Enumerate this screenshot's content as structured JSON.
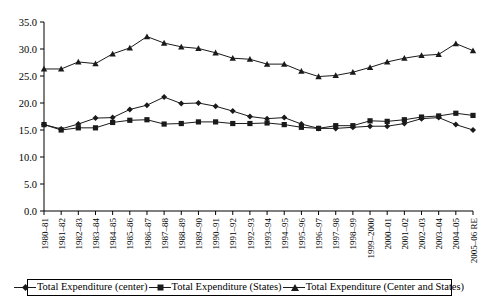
{
  "chart_data": {
    "type": "line",
    "title": "",
    "xlabel": "",
    "ylabel": "",
    "ylim": [
      0.0,
      35.0
    ],
    "yticks": [
      "0.0",
      "5.0",
      "10.0",
      "15.0",
      "20.0",
      "25.0",
      "30.0",
      "35.0"
    ],
    "ytick_values": [
      0.0,
      5.0,
      10.0,
      15.0,
      20.0,
      25.0,
      30.0,
      35.0
    ],
    "grid": false,
    "legend_position": "bottom",
    "categories": [
      "1980–81",
      "1981–82",
      "1982–83",
      "1983–84",
      "1984–85",
      "1985–86",
      "1986–87",
      "1987–88",
      "1988–89",
      "1989–90",
      "1990–91",
      "1991–92",
      "1992–93",
      "1993–94",
      "1994–95",
      "1995–96",
      "1996–97",
      "1997–98",
      "1998–99",
      "1999–2000",
      "2000–01",
      "2001–02",
      "2002–03",
      "2003–04",
      "2004–05",
      "2005–06 RE"
    ],
    "series": [
      {
        "name": "Total Expenditure (center)",
        "marker": "diamond",
        "values": [
          16.0,
          15.2,
          16.1,
          17.2,
          17.3,
          18.8,
          19.6,
          21.1,
          19.9,
          20.0,
          19.4,
          18.5,
          17.5,
          17.1,
          17.3,
          16.1,
          15.3,
          15.3,
          15.5,
          15.7,
          15.7,
          16.2,
          17.1,
          17.3,
          16.0,
          15.0
        ]
      },
      {
        "name": "Total Expenditure (States)",
        "marker": "square",
        "values": [
          16.0,
          15.0,
          15.4,
          15.4,
          16.4,
          16.8,
          16.9,
          16.1,
          16.2,
          16.5,
          16.5,
          16.2,
          16.2,
          16.3,
          16.0,
          15.5,
          15.3,
          15.8,
          15.8,
          16.7,
          16.6,
          16.9,
          17.4,
          17.6,
          18.1,
          17.7
        ]
      },
      {
        "name": "Total Expenditure (Center and States)",
        "marker": "triangle",
        "values": [
          26.3,
          26.3,
          27.6,
          27.3,
          29.1,
          30.2,
          32.3,
          31.1,
          30.4,
          30.1,
          29.3,
          28.3,
          28.1,
          27.2,
          27.2,
          25.9,
          24.9,
          25.1,
          25.7,
          26.6,
          27.6,
          28.3,
          28.8,
          29.0,
          31.0,
          29.7
        ]
      }
    ]
  },
  "legend": {
    "items": [
      {
        "label": "Total Expenditure (center)",
        "marker": "diamond-marker-icon"
      },
      {
        "label": "Total Expenditure (States)",
        "marker": "square-marker-icon"
      },
      {
        "label": "Total Expenditure (Center and States)",
        "marker": "triangle-marker-icon"
      }
    ]
  }
}
